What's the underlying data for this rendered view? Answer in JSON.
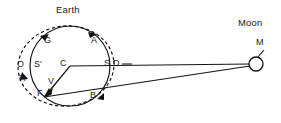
{
  "figure": {
    "title_earth": "Earth",
    "title_moon": "Moon",
    "background_color": "#ffffff",
    "line_color": "#111111"
  },
  "labels": {
    "earth": "Earth",
    "moon": "Moon",
    "m": "M",
    "a": "A",
    "b": "B",
    "c": "C",
    "d": "D",
    "f": "F",
    "g": "G",
    "h": "H",
    "o": "O",
    "s": "S",
    "s_prime": "S'",
    "v": "V"
  },
  "diagram_data": {
    "type": "diagram",
    "subject": "earth-moon tidal bulge geometry",
    "earth_circle": {
      "label": "Earth",
      "center_label": "C",
      "center_x": 70,
      "center_y": 66,
      "radius": 40
    },
    "tidal_ellipse": {
      "style": "dashed",
      "center_x": 66,
      "center_y": 66,
      "radius_x": 48,
      "radius_y": 40,
      "rotation_deg": -6
    },
    "moon": {
      "label": "Moon",
      "point_label": "M",
      "center_x": 256,
      "center_y": 64,
      "radius": 7
    },
    "points": [
      {
        "name": "Earth",
        "label": "Earth",
        "x": 72,
        "y": 9,
        "kind": "title"
      },
      {
        "name": "Moon",
        "label": "Moon",
        "x": 254,
        "y": 22,
        "kind": "title"
      },
      {
        "name": "M",
        "label": "M",
        "x": 258,
        "y": 44,
        "kind": "point"
      },
      {
        "name": "G",
        "label": "G",
        "x": 45,
        "y": 39,
        "kind": "point"
      },
      {
        "name": "A",
        "label": "A",
        "x": 93,
        "y": 38,
        "kind": "point"
      },
      {
        "name": "O",
        "label": "O",
        "x": 20,
        "y": 63,
        "kind": "point"
      },
      {
        "name": "S'",
        "label": "S'",
        "x": 39,
        "y": 63,
        "kind": "point"
      },
      {
        "name": "C",
        "label": "C",
        "x": 67,
        "y": 63,
        "kind": "point"
      },
      {
        "name": "S",
        "label": "S",
        "x": 110,
        "y": 63,
        "kind": "point"
      },
      {
        "name": "D",
        "label": "D",
        "x": 120,
        "y": 63,
        "kind": "point"
      },
      {
        "name": "H",
        "label": "H",
        "x": 22,
        "y": 78,
        "kind": "point"
      },
      {
        "name": "V",
        "label": "V",
        "x": 51,
        "y": 80,
        "kind": "point"
      },
      {
        "name": "F",
        "label": "F",
        "x": 40,
        "y": 93,
        "kind": "point"
      },
      {
        "name": "B",
        "label": "B",
        "x": 93,
        "y": 95,
        "kind": "point"
      }
    ],
    "sight_lines": [
      {
        "from": "C",
        "to": "M",
        "style": "solid",
        "description": "center of Earth to Moon"
      },
      {
        "from": "F",
        "to": "M",
        "style": "solid",
        "description": "observer F to Moon"
      },
      {
        "from": "C",
        "to": "F",
        "style": "solid",
        "description": "radius to observer F"
      }
    ],
    "arrows_on_ellipse": [
      {
        "near": "G",
        "direction": "counterclockwise"
      },
      {
        "near": "A",
        "direction": "counterclockwise"
      },
      {
        "near": "H",
        "direction": "counterclockwise"
      },
      {
        "near": "B",
        "direction": "counterclockwise"
      }
    ],
    "arrows_inside": [
      {
        "from": "C",
        "to": "V",
        "description": "vector toward V"
      },
      {
        "from": "C",
        "to": "F",
        "description": "vector toward F"
      }
    ]
  }
}
